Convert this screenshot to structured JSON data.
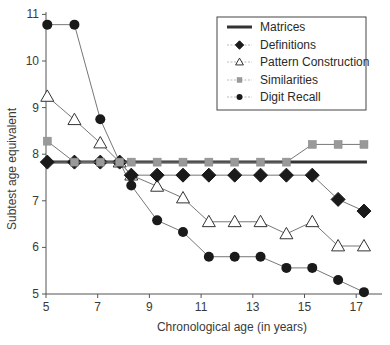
{
  "chart_data": {
    "type": "line",
    "title": "",
    "xlabel": "Chronological age (in years)",
    "ylabel": "Subtest age equivalent",
    "xlim": [
      5,
      18
    ],
    "ylim": [
      5,
      11
    ],
    "xticks": [
      5,
      7,
      9,
      11,
      13,
      15,
      17
    ],
    "yticks": [
      5,
      6,
      7,
      8,
      9,
      10,
      11
    ],
    "grid": false,
    "legend_position": "top-right",
    "x": [
      5.05,
      6.1,
      7.1,
      7.85,
      8.3,
      9.3,
      10.3,
      11.3,
      12.3,
      13.3,
      14.3,
      15.3,
      16.3,
      17.3
    ],
    "series": [
      {
        "name": "Matrices",
        "style": "line",
        "marker": "none",
        "color": "#333333",
        "values": [
          7.83,
          7.83,
          7.83,
          7.83,
          7.83,
          7.83,
          7.83,
          7.83,
          7.83,
          7.83,
          7.83,
          7.83,
          7.83,
          7.83
        ]
      },
      {
        "name": "Definitions",
        "style": "line-marker",
        "marker": "diamond",
        "color": "#1a1a1a",
        "values": [
          7.83,
          7.83,
          7.83,
          7.83,
          7.55,
          7.55,
          7.55,
          7.55,
          7.55,
          7.55,
          7.55,
          7.55,
          7.03,
          6.78
        ]
      },
      {
        "name": "Pattern Construction",
        "style": "line-marker",
        "marker": "triangle-open",
        "color": "#ffffff",
        "values": [
          9.24,
          8.74,
          8.24,
          7.83,
          7.55,
          7.31,
          7.06,
          6.55,
          6.55,
          6.55,
          6.29,
          6.55,
          6.03,
          6.03
        ]
      },
      {
        "name": "Similarities",
        "style": "line-marker",
        "marker": "square",
        "color": "#999999",
        "values": [
          8.28,
          7.83,
          7.83,
          7.83,
          7.83,
          7.83,
          7.83,
          7.83,
          7.83,
          7.83,
          7.83,
          8.21,
          8.21,
          8.21
        ]
      },
      {
        "name": "Digit Recall",
        "style": "line-marker",
        "marker": "circle",
        "color": "#1a1a1a",
        "values": [
          10.78,
          10.78,
          8.75,
          7.83,
          7.33,
          6.58,
          6.33,
          5.8,
          5.8,
          5.8,
          5.56,
          5.56,
          5.3,
          5.04
        ]
      }
    ]
  }
}
